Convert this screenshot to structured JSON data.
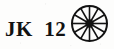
{
  "canvas": {
    "width": 114,
    "height": 49,
    "background_color": "#fdfdfc",
    "ink_color": "#121212"
  },
  "label": {
    "text": "JK  12",
    "prefix": "JK",
    "number": "12"
  },
  "icon": {
    "name": "spoked-wheel-icon",
    "spoke_count": 12,
    "center_x": 20.5,
    "center_y": 20.5,
    "radius": 18.5,
    "hub_radius": 4.2,
    "rim_stroke_width": 2.0,
    "spoke_stroke_width": 1.6,
    "color": "#121212"
  }
}
